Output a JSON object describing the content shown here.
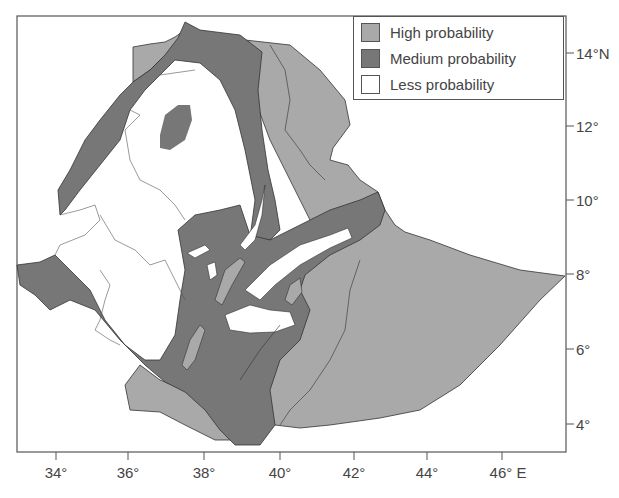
{
  "map": {
    "region": "Ethiopia",
    "colors": {
      "high": "#a9a9a9",
      "medium": "#777777",
      "less": "#ffffff",
      "border": "#333333",
      "frame": "#555555"
    },
    "legend": {
      "items": [
        {
          "label": "High probability",
          "color": "#a9a9a9"
        },
        {
          "label": "Medium probability",
          "color": "#777777"
        },
        {
          "label": "Less probability",
          "color": "#ffffff"
        }
      ]
    },
    "axes": {
      "x_ticks": [
        {
          "label": "34°",
          "px": 56
        },
        {
          "label": "36°",
          "px": 128
        },
        {
          "label": "38°",
          "px": 204
        },
        {
          "label": "40°",
          "px": 280
        },
        {
          "label": "42°",
          "px": 354
        },
        {
          "label": "44°",
          "px": 427
        },
        {
          "label": "46° E",
          "px": 502
        }
      ],
      "y_ticks": [
        {
          "label": "14°N",
          "px": 53
        },
        {
          "label": "12°",
          "px": 126
        },
        {
          "label": "10°",
          "px": 200
        },
        {
          "label": "8°",
          "px": 274
        },
        {
          "label": "6°",
          "px": 349
        },
        {
          "label": "4°",
          "px": 424
        }
      ]
    }
  }
}
